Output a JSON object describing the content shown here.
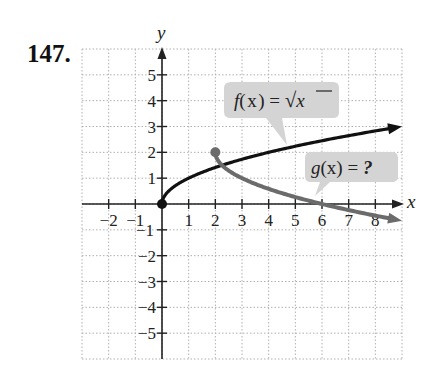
{
  "problem": {
    "number": "147."
  },
  "chart_data": {
    "type": "line",
    "title": "",
    "xlabel": "x",
    "ylabel": "y",
    "xlim": [
      -3,
      9
    ],
    "ylim": [
      -6,
      6
    ],
    "grid": true,
    "x_ticks": [
      -2,
      -1,
      1,
      2,
      3,
      4,
      5,
      6,
      7,
      8
    ],
    "y_ticks": [
      -5,
      -4,
      -3,
      -2,
      -1,
      1,
      2,
      3,
      4,
      5
    ],
    "x_tick_labels": [
      "−2",
      "−1",
      "1",
      "2",
      "3",
      "4",
      "5",
      "6",
      "7",
      "8"
    ],
    "y_tick_labels": [
      "−5",
      "−4",
      "−3",
      "−2",
      "−1",
      "1",
      "2",
      "3",
      "4",
      "5"
    ],
    "series": [
      {
        "name": "f(x) = √x",
        "color": "#111111",
        "start_point": [
          0,
          0
        ],
        "x": [
          0,
          1,
          2,
          3,
          4,
          5,
          6,
          7,
          8,
          9
        ],
        "values": [
          0,
          1,
          1.41,
          1.73,
          2,
          2.24,
          2.45,
          2.65,
          2.83,
          3
        ],
        "arrow_end": true
      },
      {
        "name": "g(x) = ?",
        "color": "#6b6b6b",
        "start_point": [
          2,
          2
        ],
        "x": [
          2,
          3,
          4,
          5,
          6,
          7,
          8,
          9
        ],
        "values": [
          2,
          1,
          0.59,
          0.27,
          0,
          -0.24,
          -0.45,
          -0.65
        ],
        "arrow_end": true
      }
    ],
    "annotations": [
      {
        "text": "f(x) = √x",
        "target": "f"
      },
      {
        "text": "g(x) = ?",
        "target": "g"
      }
    ]
  },
  "labels": {
    "x_axis": "x",
    "y_axis": "y",
    "callout_f_prefix": "f",
    "callout_f_paren": "(x) = ",
    "callout_f_sqrt": "√",
    "callout_f_var": "x",
    "callout_g_prefix": "g",
    "callout_g_paren": "(x) = ",
    "callout_g_q": "?"
  },
  "colors": {
    "axis": "#222222",
    "grid": "#b0b0b0",
    "f_curve": "#111111",
    "g_curve": "#6b6b6b",
    "callout_fill": "#d4d4d4"
  }
}
